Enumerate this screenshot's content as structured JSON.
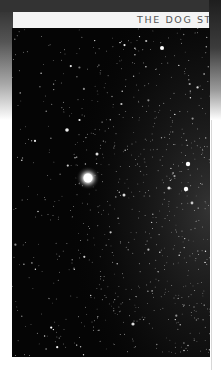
{
  "header": {
    "title": "THE DOG ST"
  },
  "photo": {
    "subject": "star-field",
    "bright_star_center": [
      88,
      178
    ],
    "colors": {
      "sky": "#050505",
      "star": "#ffffff",
      "header_bg": "#f4f4f4",
      "header_text": "#555555"
    }
  }
}
